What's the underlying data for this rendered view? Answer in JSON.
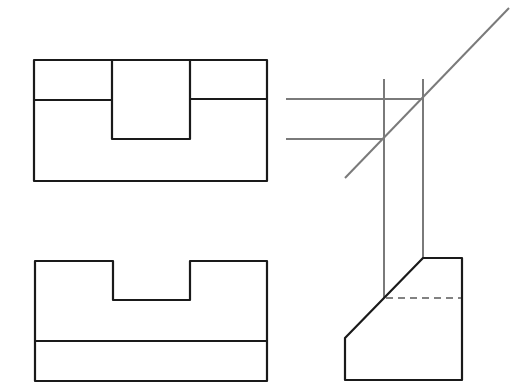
{
  "diagram": {
    "type": "orthographic-projection",
    "colors": {
      "object_line": "#1a1a1a",
      "construction_line": "#7a7a7a",
      "hidden_line": "#5a5a5a",
      "background": "#ffffff"
    },
    "views": {
      "top_view": {
        "outline": [
          [
            34,
            60
          ],
          [
            267,
            60
          ],
          [
            267,
            181
          ],
          [
            34,
            181
          ]
        ],
        "slot": [
          [
            112,
            60
          ],
          [
            112,
            139
          ],
          [
            190,
            139
          ],
          [
            190,
            60
          ]
        ],
        "left_edge": [
          [
            34,
            100
          ],
          [
            112,
            100
          ]
        ],
        "right_edge": [
          [
            190,
            99
          ],
          [
            267,
            99
          ]
        ]
      },
      "front_view": {
        "outline": [
          [
            35,
            261
          ],
          [
            113,
            261
          ],
          [
            113,
            300
          ],
          [
            190,
            300
          ],
          [
            190,
            261
          ],
          [
            267,
            261
          ],
          [
            267,
            381
          ],
          [
            35,
            381
          ]
        ],
        "base_line": [
          [
            35,
            341
          ],
          [
            267,
            341
          ]
        ]
      },
      "side_view": {
        "outline": [
          [
            423,
            258
          ],
          [
            462,
            258
          ],
          [
            462,
            380
          ],
          [
            345,
            380
          ],
          [
            345,
            338
          ],
          [
            384,
            298
          ]
        ],
        "hidden_line": [
          [
            384,
            298
          ],
          [
            462,
            298
          ]
        ]
      }
    },
    "construction": {
      "miter_line": [
        [
          345,
          178
        ],
        [
          509,
          8
        ]
      ],
      "horizontal_projectors": [
        [
          [
            286,
            99
          ],
          [
            423,
            99
          ]
        ],
        [
          [
            286,
            139
          ],
          [
            384,
            139
          ]
        ]
      ],
      "vertical_projectors": [
        [
          [
            384,
            79
          ],
          [
            384,
            298
          ]
        ],
        [
          [
            423,
            79
          ],
          [
            423,
            258
          ]
        ]
      ]
    }
  }
}
